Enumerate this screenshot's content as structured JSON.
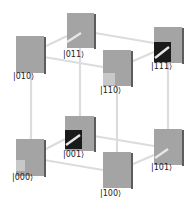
{
  "diagram": {
    "type": "three-qubit state cube",
    "colors": {
      "square_face": "#a4a4a4",
      "square_edge": "#5c5c5c",
      "phase_dark": "#1a1a1a",
      "phase_light": "#c8c8c8",
      "cube_edges": "#dcdcdc",
      "label": "#222222"
    },
    "nodes": [
      {
        "id": "000",
        "label": "|000⟩",
        "layer": "bottom",
        "inner": "light-small"
      },
      {
        "id": "001",
        "label": "|001⟩",
        "layer": "bottom",
        "inner": "dark"
      },
      {
        "id": "010",
        "label": "|010⟩",
        "layer": "top",
        "inner": "none"
      },
      {
        "id": "011",
        "label": "|011⟩",
        "layer": "top",
        "inner": "none"
      },
      {
        "id": "100",
        "label": "|100⟩",
        "layer": "bottom",
        "inner": "none"
      },
      {
        "id": "101",
        "label": "|101⟩",
        "layer": "bottom",
        "inner": "none"
      },
      {
        "id": "110",
        "label": "|110⟩",
        "layer": "top",
        "inner": "light-small"
      },
      {
        "id": "111",
        "label": "|111⟩",
        "layer": "top",
        "inner": "dark"
      }
    ]
  }
}
